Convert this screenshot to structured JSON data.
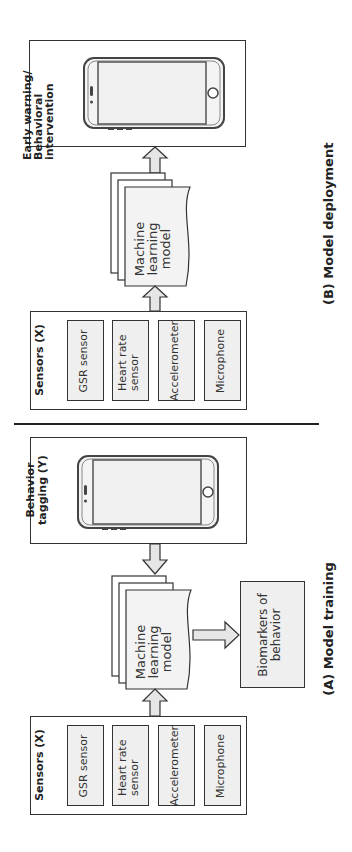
{
  "panel_b": {
    "caption": "(B)  Model deployment",
    "sensors": {
      "title": "Sensors (X)",
      "items": [
        "GSR sensor",
        "Heart rate sensor",
        "Accelerometer",
        "Microphone"
      ]
    },
    "model": {
      "label": "Machine learning model"
    },
    "output": {
      "title": "Early warning/ Behavioral intervention"
    }
  },
  "panel_a": {
    "caption": "(A)  Model training",
    "sensors": {
      "title": "Sensors (X)",
      "items": [
        "GSR sensor",
        "Heart rate sensor",
        "Accelerometer",
        "Microphone"
      ]
    },
    "model": {
      "label": "Machine learning model"
    },
    "tagging": {
      "title": "Behavior tagging (Y)"
    },
    "biomarkers": {
      "label": "Biomarkers of behavior"
    }
  },
  "colors": {
    "stroke": "#333333",
    "fill_box": "#efefef",
    "fill_arrow": "#e6e6e6"
  }
}
